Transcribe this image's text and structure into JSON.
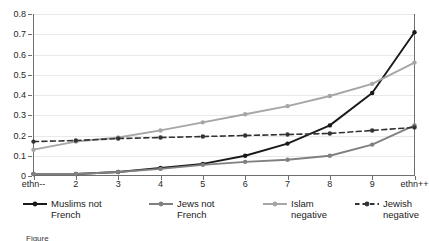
{
  "chart_data": {
    "type": "line",
    "title": "",
    "xlabel": "",
    "ylabel": "",
    "categories": [
      "ethn--",
      "2",
      "3",
      "4",
      "5",
      "6",
      "7",
      "8",
      "9",
      "ethn++"
    ],
    "ylim": [
      0,
      0.8
    ],
    "yticks": [
      "0",
      "0.1",
      "0.2",
      "0.3",
      "0.4",
      "0.5",
      "0.6",
      "0.7",
      "0.8"
    ],
    "ytick_values": [
      0,
      0.1,
      0.2,
      0.3,
      0.4,
      0.5,
      0.6,
      0.7,
      0.8
    ],
    "grid": "horizontal",
    "legend_position": "bottom",
    "series": [
      {
        "name": "Muslims not French",
        "color": "#1a1a1a",
        "style": "solid",
        "marker": "circle",
        "values": [
          0.01,
          0.01,
          0.02,
          0.04,
          0.06,
          0.1,
          0.16,
          0.25,
          0.41,
          0.71
        ]
      },
      {
        "name": "Jews not French",
        "color": "#808080",
        "style": "solid",
        "marker": "circle",
        "values": [
          0.01,
          0.01,
          0.02,
          0.035,
          0.055,
          0.07,
          0.08,
          0.1,
          0.155,
          0.25
        ]
      },
      {
        "name": "Islam negative",
        "color": "#a6a6a6",
        "style": "solid",
        "marker": "circle",
        "values": [
          0.13,
          0.17,
          0.19,
          0.225,
          0.265,
          0.305,
          0.345,
          0.395,
          0.455,
          0.56
        ]
      },
      {
        "name": "Jewish negative",
        "color": "#333333",
        "style": "dashed",
        "marker": "circle",
        "values": [
          0.17,
          0.175,
          0.185,
          0.19,
          0.195,
          0.2,
          0.205,
          0.21,
          0.225,
          0.24
        ]
      }
    ]
  },
  "legend": {
    "items": [
      {
        "label": "Muslims not\nFrench",
        "icon": "line-solid-dark-icon"
      },
      {
        "label": "Jews not\nFrench",
        "icon": "line-solid-gray-icon"
      },
      {
        "label": "Islam\nnegative",
        "icon": "line-solid-light-icon"
      },
      {
        "label": "Jewish\nnegative",
        "icon": "line-dashed-dark-icon"
      }
    ]
  },
  "caption": {
    "text": "Figure"
  }
}
